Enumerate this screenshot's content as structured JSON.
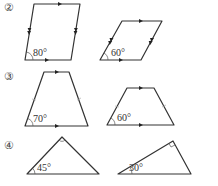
{
  "problems": [
    {
      "label": "②",
      "figures": [
        {
          "type": "parallelogram",
          "angle_label": "80°"
        },
        {
          "type": "parallelogram",
          "angle_label": "60°"
        }
      ]
    },
    {
      "label": "③",
      "figures": [
        {
          "type": "isosceles-trapezoid",
          "angle_label": "70°"
        },
        {
          "type": "isosceles-trapezoid",
          "angle_label": "60°"
        }
      ]
    },
    {
      "label": "④",
      "figures": [
        {
          "type": "right-triangle",
          "angle_label": "45°"
        },
        {
          "type": "right-triangle",
          "angle_label": "30°"
        }
      ]
    }
  ],
  "colors": {
    "stroke": "#333333",
    "background": "#ffffff"
  }
}
